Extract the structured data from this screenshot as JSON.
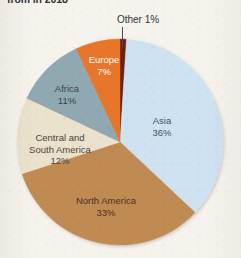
{
  "figure": {
    "title": "from in 2018",
    "background_color": "#f6f3ed"
  },
  "chart_data": {
    "type": "pie",
    "title": "from in 2018",
    "xlabel": "",
    "ylabel": "",
    "unit": "%",
    "legend": "none (labels placed on slices)",
    "grid": false,
    "start_angle_deg": 0,
    "direction": "clockwise",
    "categories": [
      "Other",
      "Asia",
      "North America",
      "Central and South America",
      "Africa",
      "Europe"
    ],
    "values": [
      1,
      36,
      33,
      12,
      11,
      7
    ],
    "colors": [
      "#6b2418",
      "#cfe2f2",
      "#c08a52",
      "#eae2cd",
      "#90a8b1",
      "#e8762c"
    ],
    "slices": [
      {
        "name": "Other",
        "value": 1,
        "label": "Other 1%",
        "percent_text": "1%",
        "color": "#6b2418",
        "label_placement": "outside-top",
        "has_leader_line": true
      },
      {
        "name": "Asia",
        "value": 36,
        "label": "Asia",
        "percent_text": "36%",
        "color": "#cfe2f2",
        "label_placement": "inside",
        "has_leader_line": false
      },
      {
        "name": "North America",
        "value": 33,
        "label": "North America",
        "percent_text": "33%",
        "color": "#c08a52",
        "label_placement": "inside",
        "has_leader_line": false
      },
      {
        "name": "Central and South America",
        "value": 12,
        "label_line1": "Central and",
        "label_line2": "South America",
        "percent_text": "12%",
        "color": "#eae2cd",
        "label_placement": "inside",
        "has_leader_line": false
      },
      {
        "name": "Africa",
        "value": 11,
        "label": "Africa",
        "percent_text": "11%",
        "color": "#90a8b1",
        "label_placement": "inside",
        "has_leader_line": false
      },
      {
        "name": "Europe",
        "value": 7,
        "label": "Europe",
        "percent_text": "7%",
        "color": "#e8762c",
        "label_placement": "inside",
        "has_leader_line": false
      }
    ]
  }
}
